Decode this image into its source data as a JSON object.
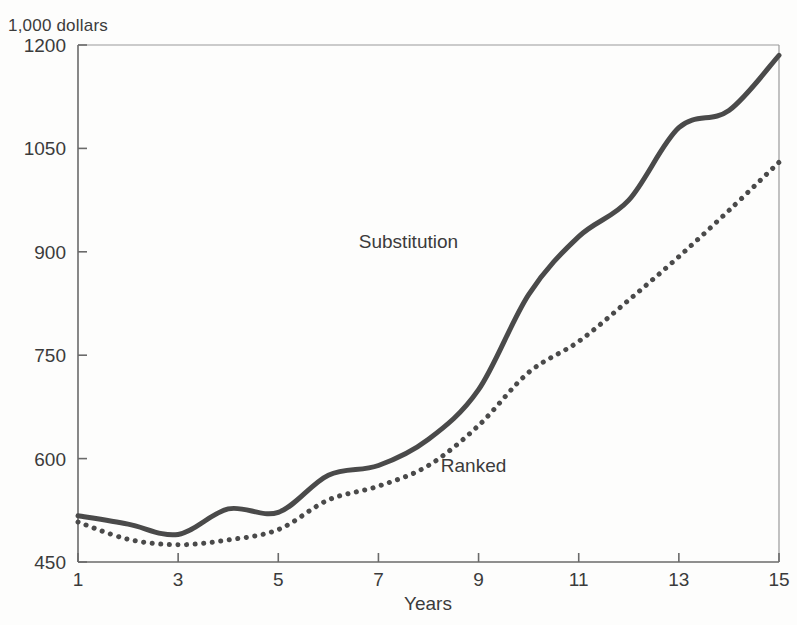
{
  "figure": {
    "ghost_caption": "",
    "unit_label": "1,000 dollars"
  },
  "chart_data": {
    "type": "line",
    "title": "",
    "subtitle": "",
    "xlabel": "Years",
    "ylabel": "1,000 dollars",
    "xlim": [
      1,
      15
    ],
    "ylim": [
      450,
      1200
    ],
    "grid": false,
    "legend_position": "inline-annotations",
    "x": [
      1,
      2,
      3,
      4,
      5,
      6,
      7,
      8,
      9,
      10,
      11,
      12,
      13,
      14,
      15
    ],
    "xticks": [
      1,
      3,
      5,
      7,
      9,
      11,
      13,
      15
    ],
    "xticklabels": [
      "1",
      "3",
      "5",
      "7",
      "9",
      "11",
      "13",
      "15"
    ],
    "yticks": [
      450,
      600,
      750,
      900,
      1050,
      1200
    ],
    "yticklabels": [
      "450",
      "600",
      "750",
      "900",
      "1050",
      "1200"
    ],
    "series": [
      {
        "name": "Substitution",
        "style": "solid",
        "color": "#4a4a4a",
        "linewidth": 5,
        "label_x": 7.6,
        "label_y": 905,
        "values": [
          517,
          505,
          490,
          527,
          522,
          576,
          590,
          628,
          700,
          838,
          922,
          975,
          1080,
          1105,
          1185
        ]
      },
      {
        "name": "Ranked",
        "style": "dotted",
        "color": "#4a4a4a",
        "linewidth": 5,
        "label_x": 8.9,
        "label_y": 580,
        "values": [
          508,
          483,
          475,
          482,
          497,
          540,
          560,
          590,
          648,
          725,
          770,
          830,
          893,
          960,
          1030
        ]
      }
    ]
  }
}
